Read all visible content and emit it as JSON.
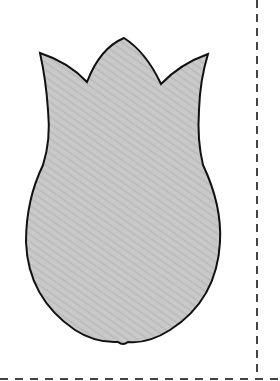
{
  "diagram": {
    "title": "Tulip cut-out template",
    "shape": {
      "name": "tulip-flower",
      "fill": "#c8c8c8",
      "stroke": "#111111",
      "stroke_width": 2
    },
    "cut_lines": {
      "style": "dashed",
      "color": "#444444",
      "vertical_x": 257,
      "horizontal_y": 379
    },
    "background": "#ffffff"
  }
}
